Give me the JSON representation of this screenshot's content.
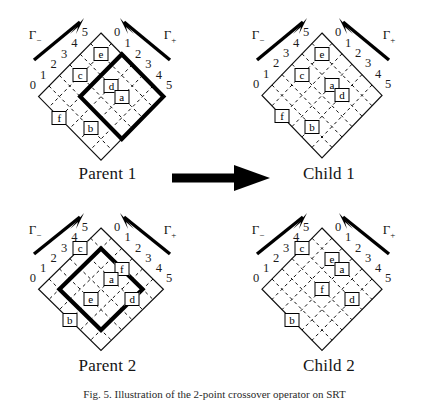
{
  "figure": {
    "bottom_caption": "Fig. 5. Illustration of the 2-point crossover operator on SRT",
    "axis_labels": [
      "0",
      "1",
      "2",
      "3",
      "4",
      "5"
    ],
    "gamma_minus": "Γ",
    "gamma_minus_sub": "−",
    "gamma_plus": "Γ",
    "gamma_plus_sub": "+",
    "arrow_icon": "right-arrow"
  },
  "panels": [
    {
      "id": "parent-1",
      "caption": "Parent 1",
      "cells": [
        {
          "label": "e",
          "col": 1,
          "row": 1
        },
        {
          "label": "d",
          "col": 3,
          "row": 2
        },
        {
          "label": "a",
          "col": 4,
          "row": 2
        },
        {
          "label": "c",
          "col": 1,
          "row": 3
        },
        {
          "label": "b",
          "col": 4,
          "row": 5
        },
        {
          "label": "f",
          "col": 2,
          "row": 6
        }
      ],
      "selection": {
        "visible": true,
        "col0": 2,
        "row0": 0,
        "size": 4
      }
    },
    {
      "id": "child-1",
      "caption": "Child 1",
      "cells": [
        {
          "label": "e",
          "col": 1,
          "row": 1
        },
        {
          "label": "a",
          "col": 3,
          "row": 2
        },
        {
          "label": "d",
          "col": 4,
          "row": 2
        },
        {
          "label": "c",
          "col": 1,
          "row": 3
        },
        {
          "label": "b",
          "col": 4,
          "row": 5
        },
        {
          "label": "f",
          "col": 2,
          "row": 6
        }
      ],
      "selection": {
        "visible": false,
        "col0": 0,
        "row0": 0,
        "size": 0
      }
    },
    {
      "id": "parent-2",
      "caption": "Parent 2",
      "cells": [
        {
          "label": "f",
          "col": 3,
          "row": 1
        },
        {
          "label": "a",
          "col": 3,
          "row": 2
        },
        {
          "label": "d",
          "col": 5,
          "row": 2
        },
        {
          "label": "c",
          "col": 0,
          "row": 2
        },
        {
          "label": "e",
          "col": 3,
          "row": 4
        },
        {
          "label": "b",
          "col": 3,
          "row": 6
        }
      ],
      "selection": {
        "visible": true,
        "col0": 1,
        "row0": 1,
        "size": 4
      }
    },
    {
      "id": "child-2",
      "caption": "Child 2",
      "cells": [
        {
          "label": "e",
          "col": 2,
          "row": 1
        },
        {
          "label": "a",
          "col": 3,
          "row": 1
        },
        {
          "label": "d",
          "col": 5,
          "row": 2
        },
        {
          "label": "c",
          "col": 0,
          "row": 2
        },
        {
          "label": "f",
          "col": 3,
          "row": 3
        },
        {
          "label": "b",
          "col": 3,
          "row": 6
        }
      ],
      "selection": {
        "visible": false,
        "col0": 0,
        "row0": 0,
        "size": 0
      }
    }
  ]
}
